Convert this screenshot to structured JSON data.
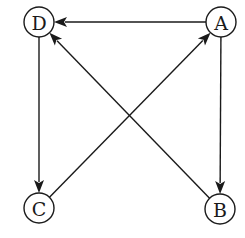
{
  "diagram": {
    "type": "directed-graph",
    "nodes": [
      {
        "id": "A",
        "label": "A"
      },
      {
        "id": "B",
        "label": "B"
      },
      {
        "id": "C",
        "label": "C"
      },
      {
        "id": "D",
        "label": "D"
      }
    ],
    "edges": [
      {
        "from": "A",
        "to": "D"
      },
      {
        "from": "B",
        "to": "D"
      },
      {
        "from": "A",
        "to": "B"
      },
      {
        "from": "D",
        "to": "C"
      },
      {
        "from": "C",
        "to": "A"
      }
    ],
    "colors": {
      "stroke": "#1a1a1a",
      "background": "#ffffff"
    }
  }
}
